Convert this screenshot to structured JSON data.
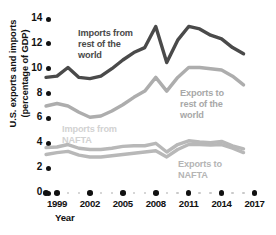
{
  "axes": {
    "y_title": "U.S. exports and imports\n(percentage of GDP)",
    "x_title": "Year",
    "y_ticks": [
      "14",
      "12",
      "10",
      "8",
      "6",
      "4",
      "2",
      "0"
    ],
    "x_ticks": [
      "1999",
      "2002",
      "2005",
      "2008",
      "2011",
      "2014",
      "2017"
    ]
  },
  "annotations": {
    "imports_row": "Imports from\nrest of the\nworld",
    "exports_row": "Exports to\nrest of the\nworld",
    "imports_nafta": "Imports from\nNAFTA",
    "exports_nafta": "Exports to\nNAFTA"
  },
  "colors": {
    "imports_row": "#4a4a4a",
    "exports_row": "#adadad",
    "imports_nafta": "#b8b8b8",
    "exports_nafta": "#b8b8b8",
    "tick": "#111111",
    "minor_tick": "#c9c9c9",
    "background": "#ffffff"
  },
  "chart_data": {
    "type": "line",
    "title": "",
    "xlabel": "Year",
    "ylabel": "U.S. exports and imports (percentage of GDP)",
    "xlim": [
      1998,
      2017
    ],
    "ylim": [
      0,
      14
    ],
    "yticks": [
      0,
      2,
      4,
      6,
      8,
      10,
      12,
      14
    ],
    "xticks": [
      1999,
      2002,
      2005,
      2008,
      2011,
      2014,
      2017
    ],
    "grid": false,
    "legend": "inline-annotations",
    "x": [
      1998,
      1999,
      2000,
      2001,
      2002,
      2003,
      2004,
      2005,
      2006,
      2007,
      2008,
      2009,
      2010,
      2011,
      2012,
      2013,
      2014,
      2015,
      2016
    ],
    "series": [
      {
        "name": "Imports from rest of the world",
        "color": "#4a4a4a",
        "values": [
          9.3,
          9.4,
          10.1,
          9.3,
          9.2,
          9.4,
          10.0,
          10.7,
          11.3,
          11.7,
          13.4,
          10.5,
          12.3,
          13.4,
          13.2,
          12.7,
          12.4,
          11.7,
          11.2
        ]
      },
      {
        "name": "Exports to rest of the world",
        "color": "#adadad",
        "values": [
          7.0,
          7.2,
          7.0,
          6.5,
          6.1,
          6.2,
          6.6,
          7.1,
          7.7,
          8.2,
          9.3,
          8.2,
          9.3,
          10.1,
          10.1,
          10.0,
          9.9,
          9.4,
          8.7
        ]
      },
      {
        "name": "Imports from NAFTA",
        "color": "#b8b8b8",
        "values": [
          3.65,
          3.7,
          3.9,
          3.6,
          3.5,
          3.5,
          3.6,
          3.75,
          3.8,
          3.8,
          4.0,
          3.3,
          3.9,
          4.2,
          4.1,
          4.05,
          4.15,
          3.8,
          3.55
        ]
      },
      {
        "name": "Exports to NAFTA",
        "color": "#b8b8b8",
        "values": [
          3.1,
          3.25,
          3.35,
          3.05,
          2.9,
          2.9,
          3.0,
          3.1,
          3.2,
          3.3,
          3.4,
          2.9,
          3.5,
          3.9,
          3.9,
          3.85,
          3.9,
          3.6,
          3.25
        ]
      }
    ]
  }
}
